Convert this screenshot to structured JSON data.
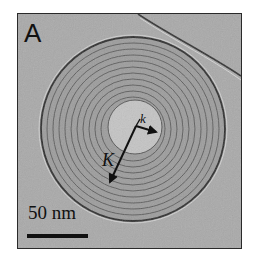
{
  "figure": {
    "panel_label": "A",
    "scale_bar": {
      "label": "50 nm"
    },
    "arrows": [
      {
        "label": "k",
        "description": "short arrow from spiral center to inner core edge"
      },
      {
        "label": "K",
        "description": "long arrow from spiral center outward through the rings"
      }
    ],
    "colors": {
      "background": "#a9a9a9",
      "rings": "#3a3a3a",
      "core": "#c4c4c4",
      "frame": "#2a2a2a"
    }
  }
}
